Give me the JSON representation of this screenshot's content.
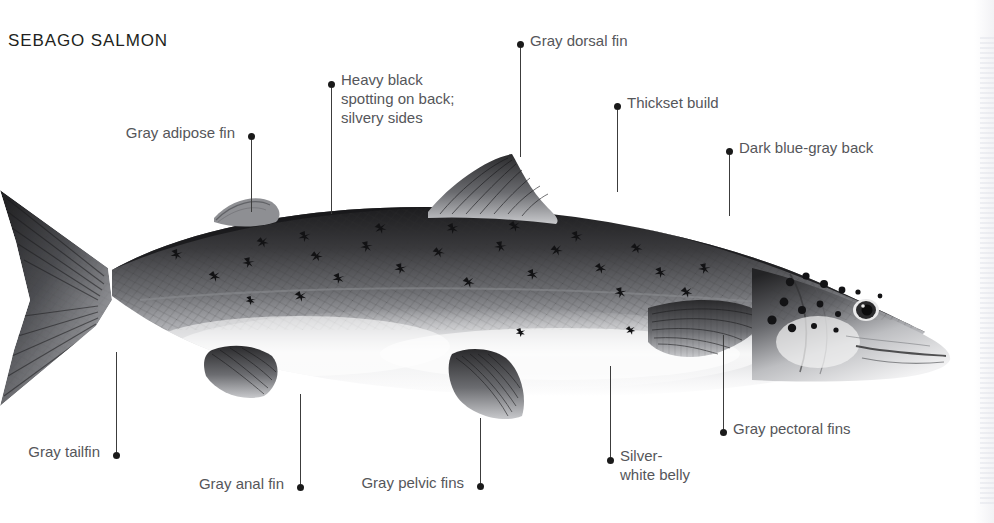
{
  "page": {
    "title": "SEBAGO SALMON",
    "background": "#ffffff",
    "label_color": "#55565a",
    "title_color": "#221f20",
    "leader_color": "#3c3c3c",
    "width": 994,
    "height": 523
  },
  "illustration": {
    "subject": "sebago-salmon",
    "style": "graphite-pencil-field-guide-drawing",
    "orientation": "left-facing-tail, right-facing-head",
    "description": "Lateral view of a landlocked Atlantic salmon with dark blue-gray back, silvery sides with heavy black x-shaped spots, and silver-white belly"
  },
  "callouts": [
    {
      "id": "gray-adipose-fin",
      "label": "Gray adipose fin",
      "side": "left",
      "dot": {
        "x": 248,
        "y": 133
      },
      "leader": {
        "x": 251,
        "y1": 140,
        "y2": 212
      }
    },
    {
      "id": "heavy-black-spotting",
      "label": "Heavy black\nspotting on back;\nsilvery sides",
      "lines": [
        "Heavy black",
        "spotting on back;",
        "silvery sides"
      ],
      "side": "right",
      "dot": {
        "x": 328,
        "y": 81
      },
      "leader": {
        "x": 331,
        "y1": 88,
        "y2": 214
      }
    },
    {
      "id": "gray-dorsal-fin",
      "label": "Gray dorsal fin",
      "side": "right",
      "dot": {
        "x": 517,
        "y": 41
      },
      "leader": {
        "x": 520,
        "y1": 48,
        "y2": 157
      }
    },
    {
      "id": "thickset-build",
      "label": "Thickset build",
      "side": "right",
      "dot": {
        "x": 614,
        "y": 103
      },
      "leader": {
        "x": 617,
        "y1": 110,
        "y2": 192
      }
    },
    {
      "id": "dark-blue-gray-back",
      "label": "Dark blue-gray back",
      "side": "right",
      "dot": {
        "x": 726,
        "y": 148
      },
      "leader": {
        "x": 729,
        "y1": 155,
        "y2": 216
      }
    },
    {
      "id": "gray-pectoral-fins",
      "label": "Gray pectoral fins",
      "side": "right",
      "dot": {
        "x": 720,
        "y": 429
      },
      "leader": {
        "x": 723,
        "y1": 335,
        "y2": 429
      }
    },
    {
      "id": "silver-white-belly",
      "label": "Silver-\nwhite belly",
      "lines": [
        "Silver-",
        "white belly"
      ],
      "side": "right",
      "dot": {
        "x": 607,
        "y": 457
      },
      "leader": {
        "x": 610,
        "y1": 366,
        "y2": 457
      }
    },
    {
      "id": "gray-pelvic-fins",
      "label": "Gray pelvic fins",
      "side": "left",
      "dot": {
        "x": 477,
        "y": 483
      },
      "leader": {
        "x": 480,
        "y1": 418,
        "y2": 483
      }
    },
    {
      "id": "gray-anal-fin",
      "label": "Gray anal fin",
      "side": "left",
      "dot": {
        "x": 297,
        "y": 484
      },
      "leader": {
        "x": 300,
        "y1": 394,
        "y2": 484
      }
    },
    {
      "id": "gray-tailfin",
      "label": "Gray tailfin",
      "side": "left",
      "dot": {
        "x": 113,
        "y": 452
      },
      "leader": {
        "x": 116,
        "y1": 352,
        "y2": 452
      }
    }
  ]
}
